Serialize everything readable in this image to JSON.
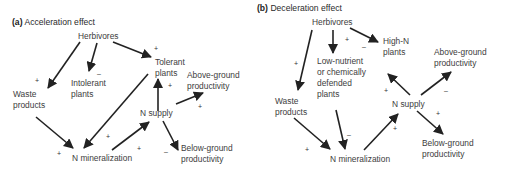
{
  "panel_a": {
    "tag": "(a)",
    "title": "Acceleration effect",
    "nodes": {
      "herbivores": "Herbivores",
      "tolerant_1": "Tolerant",
      "tolerant_2": "plants",
      "intolerant_1": "Intolerant",
      "intolerant_2": "plants",
      "waste_1": "Waste",
      "waste_2": "products",
      "above_1": "Above-ground",
      "above_2": "productivity",
      "nsupply": "N supply",
      "nmin": "N mineralization",
      "below_1": "Below-ground",
      "below_2": "productivity"
    },
    "signs": {
      "herb_tolerant": "+",
      "herb_intolerant": "–",
      "herb_waste": "+",
      "tolerant_nmin": "+",
      "waste_nmin": "+",
      "nmin_nsupply": "+",
      "nsupply_tolerant": "+",
      "nsupply_above": "+",
      "nsupply_below": "–"
    }
  },
  "panel_b": {
    "tag": "(b)",
    "title": "Deceleration effect",
    "nodes": {
      "herbivores": "Herbivores",
      "highn_1": "High-N",
      "highn_2": "plants",
      "lownut_1": "Low-nutrient",
      "lownut_2": "or chemically",
      "lownut_3": "defended",
      "lownut_4": "plants",
      "waste_1": "Waste",
      "waste_2": "products",
      "above_1": "Above-ground",
      "above_2": "productivity",
      "nsupply": "N supply",
      "nmin": "N mineralization",
      "below_1": "Below-ground",
      "below_2": "productivity"
    },
    "signs": {
      "herb_lownut": "+",
      "herb_highn": "–",
      "herb_waste": "+",
      "lownut_nmin": "–",
      "waste_nmin": "+",
      "nmin_nsupply": "+",
      "nsupply_highn": "+",
      "nsupply_above": "–",
      "nsupply_below": "+"
    }
  }
}
